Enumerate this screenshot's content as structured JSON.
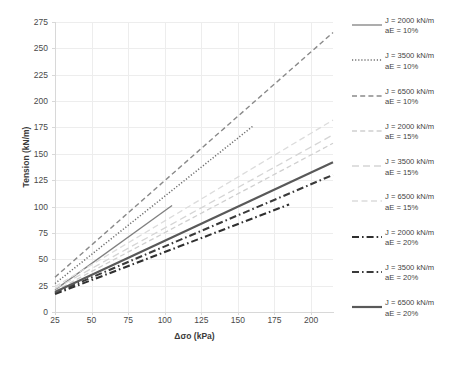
{
  "chart_data": {
    "type": "line",
    "title": "",
    "xlabel": "Δσo (kPa)",
    "ylabel": "Tension (kN/m)",
    "xlim": [
      25,
      215
    ],
    "ylim": [
      0,
      275
    ],
    "xticks": [
      25,
      50,
      75,
      100,
      125,
      150,
      175,
      200
    ],
    "yticks": [
      0,
      25,
      50,
      75,
      100,
      125,
      150,
      175,
      200,
      225,
      250,
      275
    ],
    "grid": true,
    "legend_position": "right",
    "series": [
      {
        "name": "J = 2000 kN/m aE = 10%",
        "J": 2000,
        "aE": "10%",
        "style": "solid",
        "color": "#808080",
        "width": 1.3,
        "x": [
          25,
          105
        ],
        "y": [
          21,
          101
        ]
      },
      {
        "name": "J = 3500 kN/m aE = 10%",
        "J": 3500,
        "aE": "10%",
        "style": "dotted",
        "color": "#6e6e6e",
        "width": 1.5,
        "x": [
          25,
          160
        ],
        "y": [
          27,
          176
        ]
      },
      {
        "name": "J = 6500 kN/m aE = 10%",
        "J": 6500,
        "aE": "10%",
        "style": "dashed",
        "color": "#8a8a8a",
        "width": 1.4,
        "x": [
          25,
          215
        ],
        "y": [
          33,
          265
        ]
      },
      {
        "name": "J = 2000 kN/m aE = 15%",
        "J": 2000,
        "aE": "15%",
        "style": "dashed",
        "color": "#cfcfcf",
        "width": 1.3,
        "x": [
          25,
          215
        ],
        "y": [
          20,
          160
        ]
      },
      {
        "name": "J = 3500 kN/m aE = 15%",
        "J": 3500,
        "aE": "15%",
        "style": "dash-long",
        "color": "#d5d5d5",
        "width": 1.3,
        "x": [
          25,
          215
        ],
        "y": [
          22,
          168
        ]
      },
      {
        "name": "J = 6500 kN/m aE = 15%",
        "J": 6500,
        "aE": "15%",
        "style": "dash-light",
        "color": "#dcdcdc",
        "width": 1.3,
        "x": [
          25,
          215
        ],
        "y": [
          24,
          182
        ]
      },
      {
        "name": "J = 2000 kN/m aE = 20%",
        "J": 2000,
        "aE": "20%",
        "style": "dash-dot-bold",
        "color": "#2f2f2f",
        "width": 2.1,
        "x": [
          25,
          185
        ],
        "y": [
          17,
          102
        ]
      },
      {
        "name": "J = 3500 kN/m aE = 20%",
        "J": 3500,
        "aE": "20%",
        "style": "dash-dot-bold",
        "color": "#3a3a3a",
        "width": 2.1,
        "x": [
          25,
          215
        ],
        "y": [
          18,
          130
        ]
      },
      {
        "name": "J = 6500 kN/m aE = 20%",
        "J": 6500,
        "aE": "20%",
        "style": "solid-bold",
        "color": "#595959",
        "width": 2.2,
        "x": [
          25,
          215
        ],
        "y": [
          19,
          142
        ]
      }
    ]
  },
  "axes": {
    "y_label": "Tension (kN/m)",
    "x_label": "Δσo (kPa)",
    "y_ticks": [
      "0",
      "25",
      "50",
      "75",
      "100",
      "125",
      "150",
      "175",
      "200",
      "225",
      "250",
      "275"
    ],
    "x_ticks": [
      "25",
      "50",
      "75",
      "100",
      "125",
      "150",
      "175",
      "200"
    ]
  },
  "legend": {
    "items": [
      {
        "line1": "J = 2000 kN/m",
        "line2": "aE = 10%"
      },
      {
        "line1": "J = 3500 kN/m",
        "line2": "aE = 10%"
      },
      {
        "line1": "J = 6500 kN/m",
        "line2": "aE = 10%"
      },
      {
        "line1": "J = 2000 kN/m",
        "line2": "aE = 15%"
      },
      {
        "line1": "J = 3500 kN/m",
        "line2": "aE = 15%"
      },
      {
        "line1": "J = 6500 kN/m",
        "line2": "aE = 15%"
      },
      {
        "line1": "J = 2000 kN/m",
        "line2": "aE = 20%"
      },
      {
        "line1": "J = 3500 kN/m",
        "line2": "aE = 20%"
      },
      {
        "line1": "J = 6500 kN/m",
        "line2": "aE = 20%"
      }
    ]
  },
  "colors": {
    "grid": "#ededed",
    "axis": "#d8d8d8",
    "text": "#3f3f3f",
    "background": "#ffffff"
  }
}
